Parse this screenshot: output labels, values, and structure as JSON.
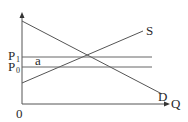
{
  "diagram": {
    "type": "supply-demand",
    "axes": {
      "y_label": "",
      "x_label": "Q",
      "origin_label": "0"
    },
    "curves": [
      {
        "name": "S",
        "label": "S",
        "kind": "supply"
      },
      {
        "name": "D",
        "label": "D",
        "kind": "demand"
      }
    ],
    "price_levels": [
      {
        "label_main": "P",
        "label_sub": "1",
        "id": "P1"
      },
      {
        "label_main": "P",
        "label_sub": "0",
        "id": "P0"
      }
    ],
    "region_label": "a",
    "colors": {
      "line": "#555555",
      "text": "#2a2a2a",
      "background": "#ffffff"
    }
  }
}
